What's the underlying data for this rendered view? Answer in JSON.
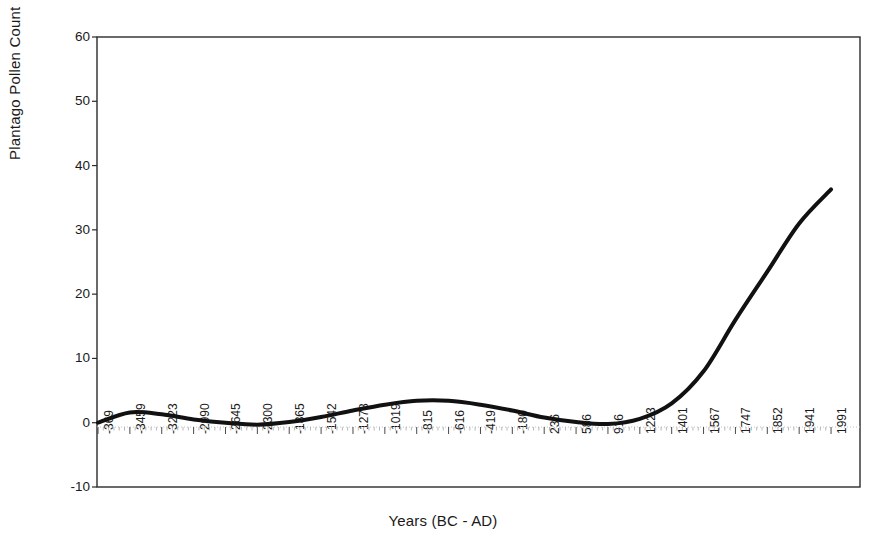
{
  "chart_data": {
    "type": "line",
    "title": "",
    "xlabel": "Years (BC - AD)",
    "ylabel": "Plantago Pollen Count",
    "ylim": [
      -10,
      60
    ],
    "yticks": [
      60,
      50,
      40,
      30,
      20,
      10,
      0,
      -10
    ],
    "grid": false,
    "legend": null,
    "categories": [
      "-369",
      "-3459",
      "-3223",
      "-2990",
      "-2645",
      "-2300",
      "-1865",
      "-1542",
      "-1278",
      "-1019",
      "-815",
      "-616",
      "-419",
      "-180",
      "236",
      "586",
      "916",
      "1223",
      "1401",
      "1567",
      "1747",
      "1852",
      "1941",
      "1991"
    ],
    "series": [
      {
        "name": "Plantago Pollen Count",
        "values": [
          0.0,
          1.6,
          1.3,
          0.5,
          0.0,
          -0.3,
          0.1,
          0.9,
          1.9,
          2.8,
          3.4,
          3.4,
          2.8,
          1.9,
          0.8,
          0.1,
          -0.2,
          0.6,
          3.0,
          8.0,
          16.0,
          23.5,
          31.0,
          36.3
        ]
      }
    ]
  },
  "axes": {
    "y_title": "Plantago Pollen Count",
    "x_title": "Years (BC - AD)",
    "y_ticks": [
      "60",
      "50",
      "40",
      "30",
      "20",
      "10",
      "0",
      "-10"
    ],
    "x_ticks": [
      "-369",
      "-3459",
      "-3223",
      "-2990",
      "-2645",
      "-2300",
      "-1865",
      "-1542",
      "-1278",
      "-1019",
      "-815",
      "-616",
      "-419",
      "-180",
      "236",
      "586",
      "916",
      "1223",
      "1401",
      "1567",
      "1747",
      "1852",
      "1941",
      "1991"
    ]
  },
  "colors": {
    "line": "#111111",
    "axis": "#2b2b2b",
    "zero_grid": "#b9b9b9",
    "background": "#ffffff"
  }
}
